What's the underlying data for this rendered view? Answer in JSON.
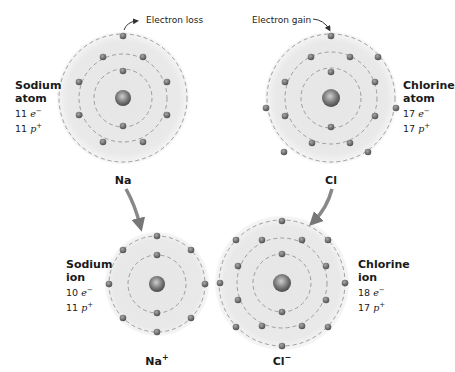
{
  "annotations": {
    "loss": "Electron loss",
    "gain": "Electron gain"
  },
  "atoms": [
    {
      "id": "na-atom",
      "name": "Sodium",
      "kind": "atom",
      "electrons": "11",
      "protons": "11",
      "symbol": "Na",
      "charge": ""
    },
    {
      "id": "cl-atom",
      "name": "Chlorine",
      "kind": "atom",
      "electrons": "17",
      "protons": "17",
      "symbol": "Cl",
      "charge": ""
    },
    {
      "id": "na-ion",
      "name": "Sodium",
      "kind": "ion",
      "electrons": "10",
      "protons": "11",
      "symbol": "Na",
      "charge": "+"
    },
    {
      "id": "cl-ion",
      "name": "Chlorine",
      "kind": "ion",
      "electrons": "18",
      "protons": "17",
      "symbol": "Cl",
      "charge": "−"
    }
  ],
  "units": {
    "e": "e",
    "e_sup": "−",
    "p": "p",
    "p_sup": "+"
  },
  "colors": {
    "shell_fill": "#e9e9e9",
    "shell_line": "#8a8a8a",
    "electron": "#6e6e6e",
    "arrow": "#777777"
  }
}
